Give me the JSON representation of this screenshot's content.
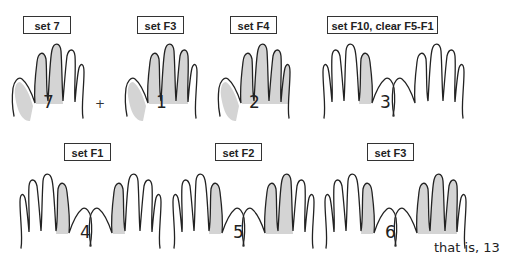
{
  "diagram": {
    "colors": {
      "shade": "#d4d4d4",
      "outline": "#222222",
      "background": "#ffffff"
    },
    "top_row": [
      {
        "label": "set 7",
        "number": "7",
        "hands": 1
      },
      {
        "operator": "+"
      },
      {
        "label": "set F3",
        "number": "1",
        "hands": 1
      },
      {
        "label": "set F4",
        "number": "2",
        "hands": 1
      },
      {
        "label": "set F10, clear F5-F1",
        "number": "3",
        "hands": 2
      }
    ],
    "bottom_row": [
      {
        "label": "set F1",
        "number": "4",
        "hands": 2
      },
      {
        "label": "set F2",
        "number": "5",
        "hands": 2
      },
      {
        "label": "set F3",
        "number": "6",
        "hands": 2
      }
    ],
    "labels": {
      "l1": "set 7",
      "l2": "set F3",
      "l3": "set F4",
      "l4": "set F10, clear F5-F1",
      "l5": "set F1",
      "l6": "set F2",
      "l7": "set F3"
    },
    "numbers": {
      "n1": "7",
      "n2": "1",
      "n3": "2",
      "n4": "3",
      "n5": "4",
      "n6": "5",
      "n7": "6"
    },
    "plus": "+",
    "result": "that is, 13"
  }
}
